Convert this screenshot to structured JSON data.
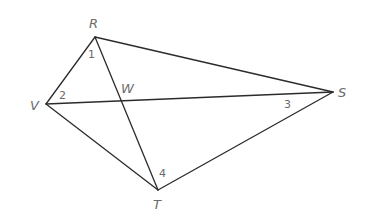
{
  "diagram": {
    "type": "quadrilateral-with-diagonals",
    "vertices": {
      "R": {
        "label": "R",
        "x": 95,
        "y": 37
      },
      "S": {
        "label": "S",
        "x": 333,
        "y": 92
      },
      "T": {
        "label": "T",
        "x": 158,
        "y": 190
      },
      "V": {
        "label": "V",
        "x": 46,
        "y": 104
      }
    },
    "intersection": {
      "label": "W",
      "x": 120,
      "y": 101
    },
    "edges": [
      [
        "R",
        "S"
      ],
      [
        "S",
        "T"
      ],
      [
        "T",
        "V"
      ],
      [
        "V",
        "R"
      ],
      [
        "R",
        "T"
      ],
      [
        "V",
        "S"
      ]
    ],
    "angles": [
      {
        "label": "1",
        "at": "R"
      },
      {
        "label": "2",
        "at": "V"
      },
      {
        "label": "3",
        "at": "S"
      },
      {
        "label": "4",
        "at": "T"
      }
    ]
  }
}
